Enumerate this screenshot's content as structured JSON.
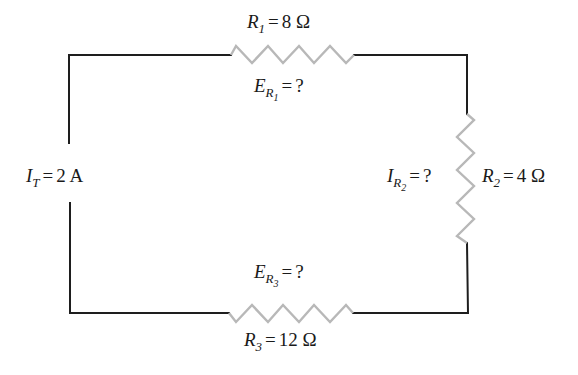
{
  "diagram": {
    "type": "series circuit",
    "colors": {
      "wire": "#1e1e1e",
      "resistor": "#b8b8b8",
      "background": "#ffffff"
    },
    "source": {
      "symbol": "I",
      "subscript": "T",
      "equals": "=",
      "value": "2 A"
    },
    "resistors": [
      {
        "id": "R1",
        "symbol": "R",
        "subscript": "1",
        "equals": "=",
        "value": "8 Ω",
        "position": "top",
        "voltage_label": {
          "symbol": "E",
          "subscript": "R",
          "subsubscript": "1",
          "equals": "=",
          "value": "?"
        }
      },
      {
        "id": "R2",
        "symbol": "R",
        "subscript": "2",
        "equals": "=",
        "value": "4 Ω",
        "position": "right",
        "current_label": {
          "symbol": "I",
          "subscript": "R",
          "subsubscript": "2",
          "equals": "=",
          "value": "?"
        }
      },
      {
        "id": "R3",
        "symbol": "R",
        "subscript": "3",
        "equals": "=",
        "value": "12 Ω",
        "position": "bottom",
        "voltage_label": {
          "symbol": "E",
          "subscript": "R",
          "subsubscript": "3",
          "equals": "=",
          "value": "?"
        }
      }
    ]
  }
}
